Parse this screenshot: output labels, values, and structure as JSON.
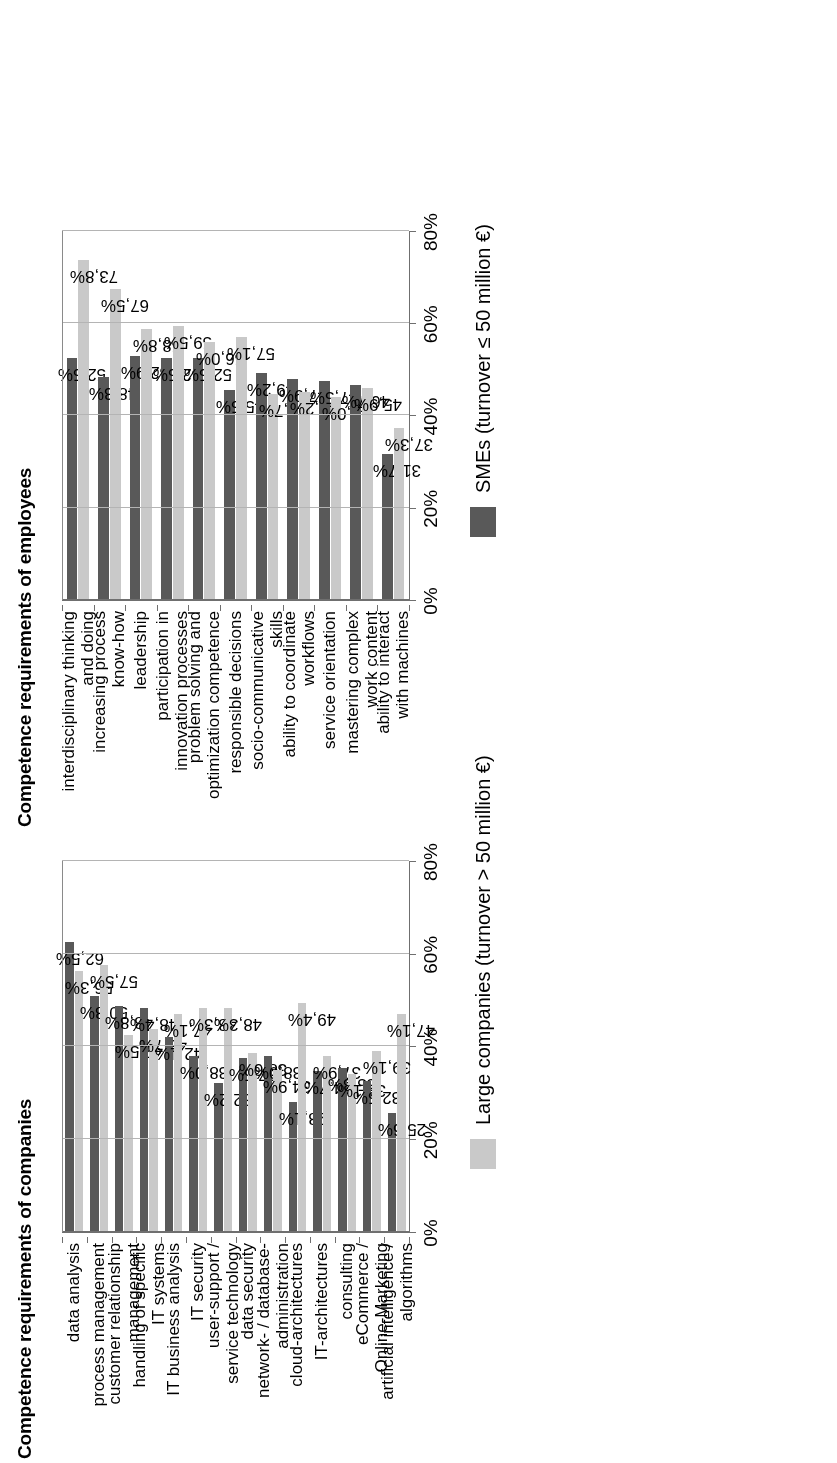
{
  "figure": {
    "orientation": "rotated-90-ccw",
    "colors": {
      "sme_bar": "#595959",
      "large_bar": "#c9c9c9",
      "gridline": "#b4b4b4",
      "axis": "#6f6f6f",
      "background": "#ffffff"
    }
  },
  "charts": [
    {
      "id": "employees",
      "title": "Competence requirements of employees",
      "legend": {
        "label": "SMEs (turnover ≤ 50 million €)",
        "series": "sme"
      }
    },
    {
      "id": "companies",
      "title": "Competence requirements of companies",
      "legend": {
        "label": "Large companies (turnover > 50 million €)",
        "series": "large"
      }
    }
  ],
  "axis": {
    "ticks": [
      "0%",
      "20%",
      "40%",
      "60%",
      "80%"
    ],
    "values": [
      0,
      20,
      40,
      60,
      80
    ]
  },
  "chart_data": [
    {
      "type": "bar",
      "id": "employees",
      "title": "Competence requirements of employees",
      "xlabel": "",
      "ylabel": "",
      "ylim": [
        0,
        80
      ],
      "grid": true,
      "legend_position": "bottom",
      "orientation": "vertical",
      "categories": [
        "interdisciplinary thinking\nand doing",
        "increasing process\nknow-how",
        "leadership",
        "participation in\ninnovation processes",
        "problem solving and\noptimization competence",
        "responsible decisions",
        "socio-communicative\nskills",
        "ability to coordinate\nworkflows",
        "service orientation",
        "mastering complex\nwork content",
        "ability to interact\nwith machines"
      ],
      "series": [
        {
          "name": "SMEs (turnover ≤ 50 million €)",
          "color": "#595959",
          "values": [
            52.5,
            48.3,
            52.9,
            52.5,
            52.5,
            45.5,
            49.2,
            47.9,
            47.5,
            46.7,
            31.7
          ],
          "labels": [
            "52,5%",
            "48,3%",
            "52,9%",
            "52,5%",
            "52,5%",
            "45,5%",
            "49,2%",
            "47,9%",
            "47,5%",
            "46,7%",
            "31,7%"
          ]
        },
        {
          "name": "Large companies (turnover > 50 million €)",
          "color": "#c9c9c9",
          "values": [
            73.8,
            67.5,
            58.8,
            59.5,
            56.0,
            57.1,
            44.7,
            45.2,
            44.0,
            45.9,
            37.3
          ],
          "labels": [
            "73,8%",
            "67,5%",
            "58,8%",
            "59,5%",
            "56,0%",
            "57,1%",
            "44,7%",
            "45,2%",
            "44,0%",
            "45,9%",
            "37,3%"
          ]
        }
      ]
    },
    {
      "type": "bar",
      "id": "companies",
      "title": "Competence requirements of companies",
      "xlabel": "",
      "ylabel": "",
      "ylim": [
        0,
        80
      ],
      "grid": true,
      "legend_position": "bottom",
      "orientation": "vertical",
      "categories": [
        "data analysis",
        "process management",
        "customer relationship\nmanagement",
        "handling of specific\nIT systems",
        "IT business analysis",
        "IT security",
        "user-support /\nservice technology",
        "data security",
        "network- / database-\nadministration",
        "cloud-architectures",
        "IT-architectures",
        "consulting",
        "eCommerce /\nOnline-Marketing",
        "artificial intelligence /\nalgorithms"
      ],
      "series": [
        {
          "name": "SMEs (turnover ≤ 50 million €)",
          "color": "#595959",
          "values": [
            62.5,
            50.8,
            48.8,
            48.4,
            42.1,
            38.0,
            32.2,
            37.5,
            38.0,
            28.1,
            34.7,
            35.3,
            32.5,
            25.6
          ],
          "labels": [
            "62,5%",
            "50,8%",
            "48,8%",
            "48,4%",
            "42,1%",
            "38,0%",
            "32,2%",
            "37,5%",
            "38,0%",
            "28,1%",
            "34,7%",
            "35,3%",
            "32,5%",
            "25,6%"
          ]
        },
        {
          "name": "Large companies (turnover > 50 million €)",
          "color": "#c9c9c9",
          "values": [
            56.3,
            57.5,
            42.5,
            43.7,
            47.1,
            48.3,
            48.3,
            38.6,
            34.9,
            49.4,
            37.9,
            34.1,
            39.1,
            47.1
          ],
          "labels": [
            "56,3%",
            "57,5%",
            "42,5%",
            "43,7%",
            "47,1%",
            "48,3%",
            "48,3%",
            "38,6%",
            "34,9%",
            "49,4%",
            "37,9%",
            "34,1%",
            "39,1%",
            "47,1%"
          ]
        }
      ]
    }
  ]
}
